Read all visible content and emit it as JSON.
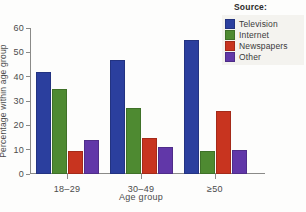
{
  "chart_data": {
    "type": "bar",
    "title": "",
    "xlabel": "Age group",
    "ylabel": "Percentage within age group",
    "categories": [
      "18–29",
      "30–49",
      "≥50"
    ],
    "series": [
      {
        "name": "Television",
        "color": "#2b3f9e",
        "values": [
          42,
          47,
          55
        ]
      },
      {
        "name": "Internet",
        "color": "#4e8a31",
        "values": [
          35,
          27,
          9.5
        ]
      },
      {
        "name": "Newspapers",
        "color": "#c8341f",
        "values": [
          9.5,
          15,
          26
        ]
      },
      {
        "name": "Other",
        "color": "#6137a8",
        "values": [
          14,
          11,
          10
        ]
      }
    ],
    "ylim": [
      0,
      60
    ],
    "yticks": [
      0,
      10,
      20,
      30,
      40,
      50,
      60
    ],
    "ytick_labels": [
      "0",
      "10",
      "20",
      "30",
      "40",
      "50",
      "60"
    ],
    "grid": false,
    "legend_position": "top-right"
  },
  "legend": {
    "title": "Source:"
  },
  "caption": {
    "text": ""
  }
}
